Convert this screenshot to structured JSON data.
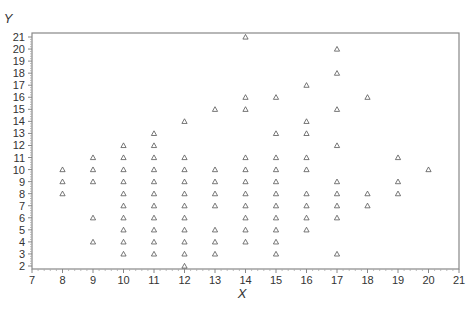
{
  "chart_data": {
    "type": "scatter",
    "title": "",
    "xlabel": "X",
    "ylabel": "Y",
    "xlim": [
      7,
      21
    ],
    "ylim": [
      2,
      21
    ],
    "xticks": [
      7,
      8,
      9,
      10,
      11,
      12,
      13,
      14,
      15,
      16,
      17,
      18,
      19,
      20,
      21
    ],
    "yticks": [
      2,
      3,
      4,
      5,
      6,
      7,
      8,
      9,
      10,
      11,
      12,
      13,
      14,
      15,
      16,
      17,
      18,
      19,
      20,
      21
    ],
    "grid": false,
    "legend": null,
    "marker": "triangle",
    "marker_color": "#555555",
    "series": [
      {
        "name": "points",
        "points": [
          [
            8,
            10
          ],
          [
            8,
            9
          ],
          [
            8,
            8
          ],
          [
            9,
            11
          ],
          [
            9,
            10
          ],
          [
            9,
            9
          ],
          [
            9,
            6
          ],
          [
            9,
            4
          ],
          [
            10,
            12
          ],
          [
            10,
            11
          ],
          [
            10,
            10
          ],
          [
            10,
            9
          ],
          [
            10,
            8
          ],
          [
            10,
            7
          ],
          [
            10,
            6
          ],
          [
            10,
            5
          ],
          [
            10,
            4
          ],
          [
            10,
            3
          ],
          [
            11,
            13
          ],
          [
            11,
            12
          ],
          [
            11,
            11
          ],
          [
            11,
            10
          ],
          [
            11,
            9
          ],
          [
            11,
            8
          ],
          [
            11,
            7
          ],
          [
            11,
            6
          ],
          [
            11,
            5
          ],
          [
            11,
            4
          ],
          [
            11,
            3
          ],
          [
            12,
            14
          ],
          [
            12,
            11
          ],
          [
            12,
            10
          ],
          [
            12,
            9
          ],
          [
            12,
            8
          ],
          [
            12,
            7
          ],
          [
            12,
            6
          ],
          [
            12,
            5
          ],
          [
            12,
            4
          ],
          [
            12,
            3
          ],
          [
            12,
            2
          ],
          [
            13,
            15
          ],
          [
            13,
            10
          ],
          [
            13,
            9
          ],
          [
            13,
            8
          ],
          [
            13,
            7
          ],
          [
            13,
            5
          ],
          [
            13,
            4
          ],
          [
            13,
            3
          ],
          [
            14,
            21
          ],
          [
            14,
            16
          ],
          [
            14,
            15
          ],
          [
            14,
            11
          ],
          [
            14,
            10
          ],
          [
            14,
            9
          ],
          [
            14,
            8
          ],
          [
            14,
            7
          ],
          [
            14,
            6
          ],
          [
            14,
            5
          ],
          [
            14,
            4
          ],
          [
            15,
            16
          ],
          [
            15,
            13
          ],
          [
            15,
            11
          ],
          [
            15,
            10
          ],
          [
            15,
            9
          ],
          [
            15,
            8
          ],
          [
            15,
            7
          ],
          [
            15,
            6
          ],
          [
            15,
            5
          ],
          [
            15,
            4
          ],
          [
            15,
            3
          ],
          [
            16,
            17
          ],
          [
            16,
            14
          ],
          [
            16,
            13
          ],
          [
            16,
            11
          ],
          [
            16,
            10
          ],
          [
            16,
            8
          ],
          [
            16,
            7
          ],
          [
            16,
            6
          ],
          [
            16,
            5
          ],
          [
            17,
            20
          ],
          [
            17,
            18
          ],
          [
            17,
            15
          ],
          [
            17,
            12
          ],
          [
            17,
            9
          ],
          [
            17,
            8
          ],
          [
            17,
            7
          ],
          [
            17,
            6
          ],
          [
            17,
            3
          ],
          [
            18,
            16
          ],
          [
            18,
            8
          ],
          [
            18,
            7
          ],
          [
            19,
            11
          ],
          [
            19,
            9
          ],
          [
            19,
            8
          ],
          [
            20,
            10
          ]
        ]
      }
    ]
  },
  "axes": {
    "x_title": "X",
    "y_title": "Y"
  }
}
